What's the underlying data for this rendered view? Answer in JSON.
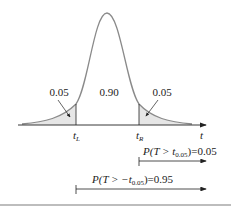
{
  "diagram": {
    "type": "t-distribution",
    "regions": {
      "left_tail": "0.05",
      "center": "0.90",
      "right_tail": "0.05"
    },
    "axis": {
      "variable": "t",
      "left_marker_base": "t",
      "left_marker_sub": "L",
      "right_marker_base": "t",
      "right_marker_sub": "R"
    },
    "annotations": [
      {
        "prefix": "P(T > t",
        "sub": "0.05",
        "suffix": ")=0.05"
      },
      {
        "prefix": "P(T > −t",
        "sub": "0.05",
        "suffix": ")=0.95"
      }
    ],
    "colors": {
      "curve": "#8a8a8a",
      "tail_fill": "#e6e6e6",
      "axis": "#222222",
      "separator": "#bdbdbd"
    }
  }
}
